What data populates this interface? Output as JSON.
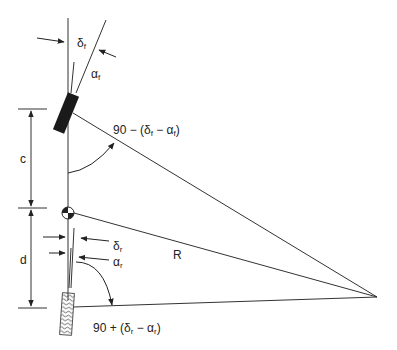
{
  "diagram": {
    "labels": {
      "delta_f": "δ",
      "delta_f_sub": "f",
      "alpha_f": "α",
      "alpha_f_sub": "f",
      "front_angle": "90 − (δ",
      "front_angle_mid": " − α",
      "front_angle_end": ")",
      "c": "c",
      "d": "d",
      "R": "R",
      "delta_r": "δ",
      "delta_r_sub": "r",
      "alpha_r": "α",
      "alpha_r_sub": "r",
      "rear_angle": "90 + (δ",
      "rear_angle_mid": " − α",
      "rear_angle_end": ")",
      "f": "f",
      "r": "r"
    },
    "colors": {
      "line": "#333333",
      "wheel_front": "#1a1a1a",
      "wheel_rear_hatch": "#555555",
      "background": "#ffffff"
    }
  }
}
